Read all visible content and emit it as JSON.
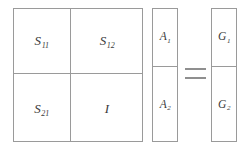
{
  "figure": {
    "type": "matrix-equation",
    "background_color": "#ffffff",
    "line_color": "#9a9a9a",
    "text_color": "#3a3a3a"
  },
  "s_matrix": {
    "name": "S",
    "rows": 2,
    "cols": 2,
    "cells": [
      {
        "base": "S",
        "sub": "11"
      },
      {
        "base": "S",
        "sub": "12"
      },
      {
        "base": "S",
        "sub": "21"
      },
      {
        "base": "I",
        "sub": ""
      }
    ]
  },
  "a_vector": {
    "name": "A",
    "cells": [
      {
        "base": "A",
        "sub": "1"
      },
      {
        "base": "A",
        "sub": "2"
      }
    ]
  },
  "operator": {
    "symbol": "=",
    "name": "equals"
  },
  "g_vector": {
    "name": "G",
    "cells": [
      {
        "base": "G",
        "sub": "1"
      },
      {
        "base": "G",
        "sub": "2"
      }
    ]
  }
}
